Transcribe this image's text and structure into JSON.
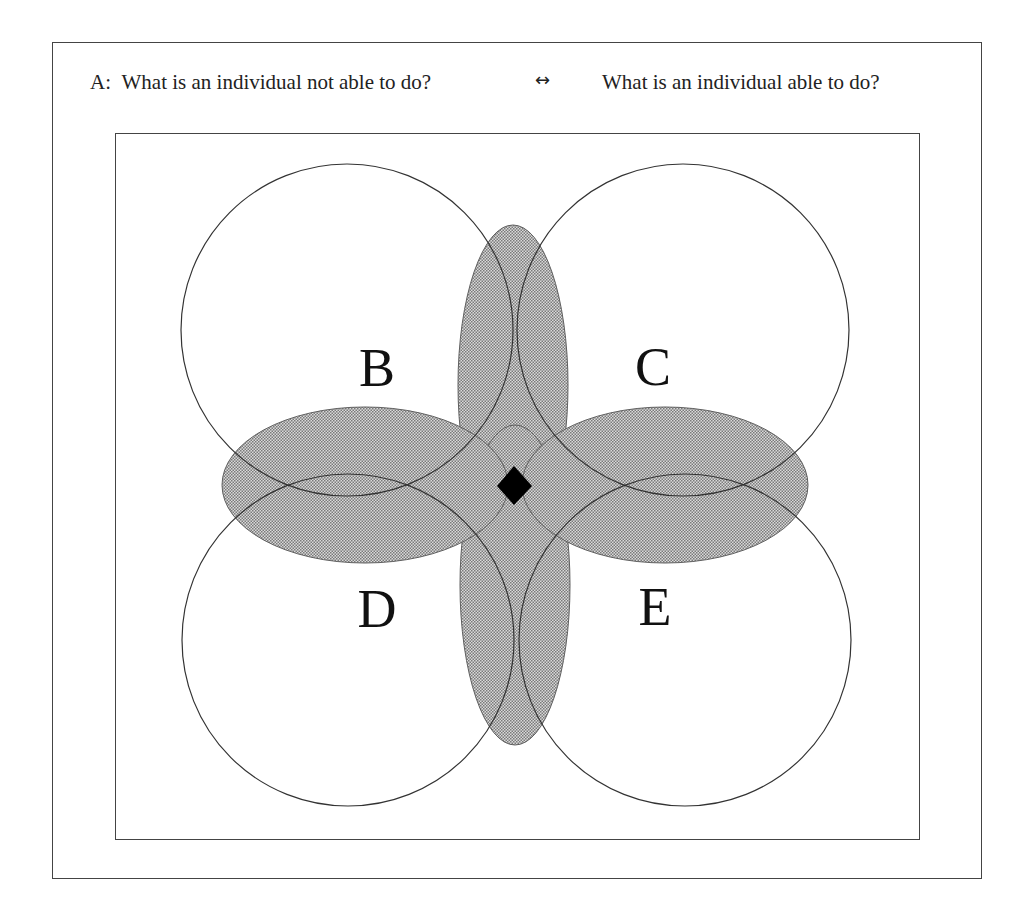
{
  "caption": {
    "prefix": "A:",
    "left_question": "What is an individual not able to do?",
    "arrow": "↔",
    "right_question": "What is an individual able to do?"
  },
  "circles": [
    {
      "label": "B",
      "cx": 347,
      "cy": 330,
      "r": 166
    },
    {
      "label": "C",
      "cx": 683,
      "cy": 330,
      "r": 166
    },
    {
      "label": "D",
      "cx": 348,
      "cy": 640,
      "r": 166
    },
    {
      "label": "E",
      "cx": 685,
      "cy": 640,
      "r": 166
    }
  ],
  "labels": {
    "B": "B",
    "C": "C",
    "D": "D",
    "E": "E"
  },
  "colors": {
    "stroke": "#333333",
    "shade": "#8a8a8a",
    "center": "#000000"
  }
}
